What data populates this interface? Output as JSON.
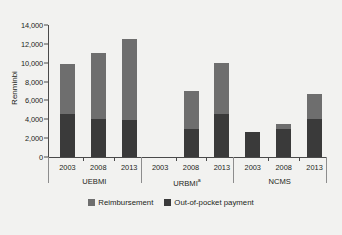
{
  "chart_data": {
    "type": "bar",
    "title": "",
    "xlabel": "",
    "ylabel": "Renminbi",
    "ylim": [
      0,
      14000
    ],
    "yticks": [
      "0",
      "2,000",
      "4,000",
      "6,000",
      "8,000",
      "10,000",
      "12,000",
      "14,000"
    ],
    "ytick_values": [
      0,
      2000,
      4000,
      6000,
      8000,
      10000,
      12000,
      14000
    ],
    "grid": false,
    "stacked": true,
    "legend_position": "bottom",
    "legend": [
      "Reimbursement",
      "Out-of-pocket payment"
    ],
    "series": [
      {
        "name": "Out-of-pocket payment",
        "color": "#3a3a3a",
        "values": [
          4600,
          4050,
          3900,
          null,
          3000,
          4600,
          2700,
          2950,
          4050
        ]
      },
      {
        "name": "Reimbursement",
        "color": "#6e6e6e",
        "values": [
          5300,
          6950,
          8600,
          null,
          4000,
          5400,
          0,
          550,
          2650
        ]
      }
    ],
    "totals": [
      9900,
      11000,
      12500,
      null,
      7000,
      10000,
      2700,
      3500,
      6700
    ],
    "categories": [
      "2003",
      "2008",
      "2013",
      "2003",
      "2008",
      "2013",
      "2003",
      "2008",
      "2013"
    ],
    "groups": [
      {
        "label": "UEBMI",
        "superscript": "",
        "years": [
          "2003",
          "2008",
          "2013"
        ]
      },
      {
        "label": "URBMI",
        "superscript": "a",
        "years": [
          "2003",
          "2008",
          "2013"
        ]
      },
      {
        "label": "NCMS",
        "superscript": "",
        "years": [
          "2003",
          "2008",
          "2013"
        ]
      }
    ]
  },
  "colors": {
    "reimbursement": "#6e6e6e",
    "out_of_pocket": "#3a3a3a",
    "background": "#f2f2f0",
    "axis": "#4a4a4a"
  }
}
